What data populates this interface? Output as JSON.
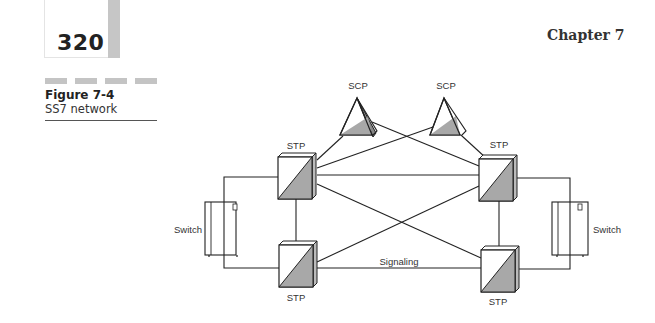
{
  "page": {
    "number": "320",
    "chapter": "Chapter 7"
  },
  "figure": {
    "label": "Figure 7-4",
    "caption": "SS7 network"
  },
  "diagram": {
    "nodes": {
      "scp_left": "SCP",
      "scp_right": "SCP",
      "stp_top_left": "STP",
      "stp_top_right": "STP",
      "stp_bottom_left": "STP",
      "stp_bottom_right": "STP",
      "switch_left": "Switch",
      "switch_right": "Switch"
    },
    "link_label": "Signaling",
    "colors": {
      "line": "#222222",
      "shade": "#a8a8a8",
      "page_bar": "#c6c6c6"
    }
  }
}
